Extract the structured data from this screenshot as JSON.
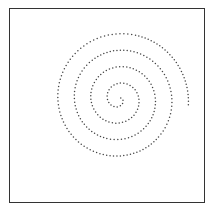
{
  "figure": {
    "frame_color": "#333333",
    "dot_color": "#444444"
  },
  "spiral": {
    "center": [
      119,
      99
    ],
    "start_radius": 2,
    "growth_per_turn": 16.5,
    "turns": 4.1,
    "start_angle_deg": -30,
    "direction": "clockwise",
    "dot_spacing": 3.3,
    "dot_radius": 0.75,
    "end_point_approx": [
      96,
      47
    ]
  }
}
